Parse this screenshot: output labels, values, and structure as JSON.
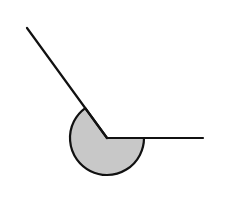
{
  "diagram": {
    "type": "reflex-angle",
    "vertex": [
      107,
      138
    ],
    "ray_horizontal_end": [
      203,
      138
    ],
    "ray_oblique_end": [
      27,
      28
    ],
    "arc_radius": 37,
    "colors": {
      "stroke": "#111111",
      "fill": "#c8c8c8",
      "background": "#ffffff"
    }
  }
}
